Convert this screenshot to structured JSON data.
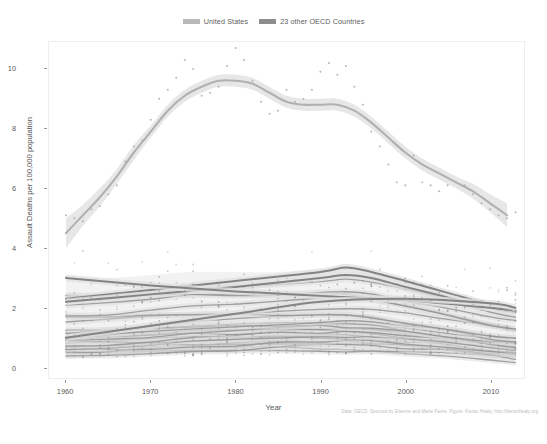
{
  "legend": {
    "position": "top",
    "entries": [
      {
        "label": "United States",
        "key_color": "#b9b9b9",
        "name": "legend-key-united-states"
      },
      {
        "label": "23 other OECD Countries",
        "key_color": "#8d8d8d",
        "name": "legend-key-oecd"
      }
    ]
  },
  "caption": "Data: OECD. Sourced by Etienne and Marie Favre. Figure: Kieran Healy, http://kieranhealy.org",
  "chart_data": {
    "type": "line",
    "title": "",
    "subtitle": "",
    "xlabel": "Year",
    "ylabel": "Assault Deaths per 100,000 population",
    "xlim": [
      1958,
      2014
    ],
    "ylim": [
      -0.35,
      10.9
    ],
    "xticks": [
      1960,
      1970,
      1980,
      1990,
      2000,
      2010
    ],
    "yticks": [
      0,
      2,
      4,
      6,
      8,
      10
    ],
    "grid": false,
    "legend_position": "top",
    "annotations": [],
    "series": [
      {
        "name": "United States",
        "kind": "loess-smooth-with-ribbon",
        "color": "#b6b6b6",
        "ribbon_color": "#e2e2e2",
        "x": [
          1960,
          1962,
          1964,
          1966,
          1968,
          1970,
          1972,
          1974,
          1976,
          1978,
          1980,
          1982,
          1984,
          1986,
          1988,
          1990,
          1992,
          1994,
          1996,
          1998,
          2000,
          2002,
          2004,
          2006,
          2008,
          2010,
          2012
        ],
        "values": [
          4.5,
          5.1,
          5.7,
          6.4,
          7.2,
          7.9,
          8.6,
          9.1,
          9.4,
          9.6,
          9.6,
          9.5,
          9.2,
          8.9,
          8.8,
          8.8,
          8.8,
          8.6,
          8.2,
          7.7,
          7.2,
          6.8,
          6.5,
          6.2,
          5.9,
          5.5,
          5.1
        ],
        "ribbon_low": [
          4.0,
          4.75,
          5.4,
          6.15,
          6.95,
          7.7,
          8.4,
          8.9,
          9.2,
          9.4,
          9.4,
          9.3,
          9.0,
          8.7,
          8.6,
          8.6,
          8.6,
          8.4,
          8.0,
          7.5,
          7.0,
          6.6,
          6.3,
          6.0,
          5.65,
          5.2,
          4.7
        ],
        "ribbon_high": [
          5.0,
          5.45,
          6.0,
          6.65,
          7.45,
          8.1,
          8.8,
          9.3,
          9.6,
          9.8,
          9.8,
          9.7,
          9.4,
          9.1,
          9.0,
          9.0,
          9.0,
          8.8,
          8.4,
          7.9,
          7.4,
          7.0,
          6.7,
          6.4,
          6.15,
          5.8,
          5.5
        ],
        "points": [
          [
            1960,
            5.1
          ],
          [
            1961,
            5.0
          ],
          [
            1962,
            4.9
          ],
          [
            1963,
            5.3
          ],
          [
            1964,
            5.4
          ],
          [
            1965,
            5.8
          ],
          [
            1966,
            6.1
          ],
          [
            1967,
            6.9
          ],
          [
            1968,
            7.4
          ],
          [
            1969,
            7.6
          ],
          [
            1970,
            8.3
          ],
          [
            1971,
            9.0
          ],
          [
            1972,
            9.3
          ],
          [
            1973,
            9.7
          ],
          [
            1974,
            10.3
          ],
          [
            1975,
            10.0
          ],
          [
            1976,
            9.1
          ],
          [
            1977,
            9.2
          ],
          [
            1978,
            9.4
          ],
          [
            1979,
            10.1
          ],
          [
            1980,
            10.7
          ],
          [
            1981,
            10.3
          ],
          [
            1982,
            9.6
          ],
          [
            1983,
            8.9
          ],
          [
            1984,
            8.5
          ],
          [
            1985,
            8.6
          ],
          [
            1986,
            9.3
          ],
          [
            1987,
            8.9
          ],
          [
            1988,
            9.0
          ],
          [
            1989,
            9.3
          ],
          [
            1990,
            9.9
          ],
          [
            1991,
            10.2
          ],
          [
            1992,
            9.8
          ],
          [
            1993,
            10.1
          ],
          [
            1994,
            9.4
          ],
          [
            1995,
            8.8
          ],
          [
            1996,
            7.9
          ],
          [
            1997,
            7.4
          ],
          [
            1998,
            6.8
          ],
          [
            1999,
            6.2
          ],
          [
            2000,
            6.1
          ],
          [
            2001,
            7.1
          ],
          [
            2002,
            6.2
          ],
          [
            2003,
            6.1
          ],
          [
            2004,
            5.9
          ],
          [
            2005,
            6.1
          ],
          [
            2006,
            6.2
          ],
          [
            2007,
            6.1
          ],
          [
            2008,
            5.8
          ],
          [
            2009,
            5.5
          ],
          [
            2010,
            5.3
          ],
          [
            2011,
            5.1
          ],
          [
            2012,
            5.0
          ],
          [
            2013,
            5.2
          ]
        ]
      },
      {
        "name": "23 other OECD Countries",
        "kind": "loess-smooth-band-bundle",
        "color": "#8a8a8a",
        "ribbon_color": "#d8d8d8",
        "note": "23 overlapping country smooths, mostly 0.4-3.3, plus two high outlier curves peaking near 3.3 around 1993",
        "x": [
          1960,
          1965,
          1970,
          1975,
          1980,
          1985,
          1990,
          1993,
          1996,
          2000,
          2005,
          2010,
          2013
        ],
        "bundle_upper": [
          3.0,
          3.0,
          3.1,
          3.2,
          3.2,
          3.2,
          3.3,
          3.35,
          3.2,
          2.9,
          2.5,
          2.1,
          1.9
        ],
        "bundle_lower": [
          0.4,
          0.4,
          0.45,
          0.5,
          0.55,
          0.6,
          0.6,
          0.6,
          0.6,
          0.55,
          0.5,
          0.35,
          0.3
        ],
        "bundle_median": [
          1.2,
          1.25,
          1.35,
          1.45,
          1.5,
          1.55,
          1.6,
          1.6,
          1.55,
          1.4,
          1.2,
          1.0,
          0.9
        ],
        "outlier_curves": [
          {
            "name": "high-curve-a",
            "x": [
              1960,
              1970,
              1980,
              1990,
              1993,
              1996,
              2000,
              2005,
              2010,
              2013
            ],
            "values": [
              2.3,
              2.6,
              2.9,
              3.2,
              3.35,
              3.2,
              2.9,
              2.5,
              2.1,
              1.9
            ]
          },
          {
            "name": "high-curve-b",
            "x": [
              1960,
              1970,
              1980,
              1990,
              1993,
              1996,
              2000,
              2005,
              2010,
              2013
            ],
            "values": [
              2.2,
              2.45,
              2.7,
              3.0,
              3.1,
              3.0,
              2.7,
              2.35,
              2.0,
              1.85
            ]
          },
          {
            "name": "declining-curve-c",
            "x": [
              1960,
              1970,
              1980,
              1990,
              2000,
              2010,
              2013
            ],
            "values": [
              3.0,
              2.75,
              2.55,
              2.4,
              2.25,
              2.0,
              1.9
            ]
          },
          {
            "name": "rising-curve-d",
            "x": [
              1960,
              1970,
              1980,
              1990,
              2000,
              2010,
              2013
            ],
            "values": [
              1.0,
              1.4,
              1.8,
              2.2,
              2.3,
              2.15,
              2.0
            ]
          }
        ]
      }
    ]
  }
}
